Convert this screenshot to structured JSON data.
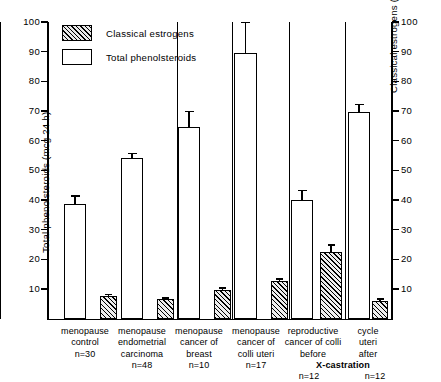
{
  "chart_data": {
    "type": "bar",
    "title": "",
    "subtitle": "",
    "xlabel": "",
    "ylabel": "Total phenolsteroids (mcg 24 h)",
    "y2label": "Classical estrogens (mcg 24 h)",
    "ylim": [
      0,
      100
    ],
    "y2lim": [
      0,
      100
    ],
    "yticks": [
      10,
      20,
      30,
      40,
      50,
      60,
      70,
      80,
      90,
      100
    ],
    "y2ticks": [
      10,
      20,
      30,
      40,
      50,
      60,
      70,
      80,
      90,
      100
    ],
    "grid": false,
    "legend_position": "top-left",
    "legend": [
      "Classical estrogens",
      "Total phenolsteroids"
    ],
    "categories": [
      "menopause control",
      "menopause endometrial carcinoma",
      "menopause cancer of breast",
      "menopause cancer of colli uteri",
      "reproductive cancer of colli uteri before X-castration",
      "cycle cancer of colli uteri after X-castration"
    ],
    "sample_sizes": [
      "n=30",
      "n=48",
      "n=10",
      "n=17",
      "n=12",
      "n=12"
    ],
    "series": [
      {
        "name": "Total phenolsteroids",
        "fill": "open",
        "values": [
          38.5,
          54.0,
          64.5,
          89.5,
          40.0,
          69.5
        ],
        "errors": [
          3.0,
          1.8,
          5.5,
          10.5,
          3.5,
          3.0
        ]
      },
      {
        "name": "Classical estrogens",
        "fill": "hatched",
        "values": [
          7.5,
          6.5,
          9.5,
          12.5,
          22.5,
          6.0
        ],
        "errors": [
          0.8,
          0.6,
          1.0,
          1.0,
          2.5,
          0.8
        ]
      }
    ]
  },
  "axes": {
    "left": {
      "title": "Total phenolsteroids (mcg 24 h)",
      "ticks": [
        "10",
        "20",
        "30",
        "40",
        "50",
        "60",
        "70",
        "80",
        "90",
        "100"
      ]
    },
    "right": {
      "title": "Classical estrogens (mcg 24 h)",
      "ticks": [
        "10",
        "20",
        "30",
        "40",
        "50",
        "60",
        "70",
        "80",
        "90",
        "100"
      ]
    }
  },
  "legend": {
    "items": [
      {
        "label": "Classical estrogens",
        "swatch": "hatched-box-icon"
      },
      {
        "label": "Total phenolsteroids",
        "swatch": "open-box-icon"
      }
    ]
  },
  "categories": [
    {
      "lines": [
        "menopause",
        "control"
      ],
      "n": "n=30"
    },
    {
      "lines": [
        "menopause",
        "endometrial",
        "carcinoma"
      ],
      "n": "n=48"
    },
    {
      "lines": [
        "menopause",
        "cancer of",
        "breast"
      ],
      "n": "n=10"
    },
    {
      "lines": [
        "menopause",
        "cancer of",
        "colli uteri"
      ],
      "n": "n=17"
    },
    {
      "lines": [
        "reproductive",
        "cancer of colli",
        "before"
      ],
      "n": "n=12"
    },
    {
      "lines": [
        "cycle",
        "uteri",
        "after"
      ],
      "n": "n=12"
    }
  ],
  "annotation": {
    "x_castration": "X-castration"
  }
}
